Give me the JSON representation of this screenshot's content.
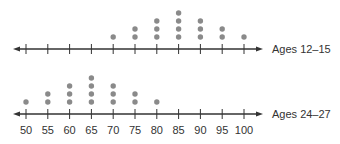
{
  "chart_data": {
    "type": "dot_plot",
    "title": "",
    "xlabel": "",
    "ylabel": "",
    "x_ticks": [
      50,
      55,
      60,
      65,
      70,
      75,
      80,
      85,
      90,
      95,
      100
    ],
    "xlim": [
      50,
      100
    ],
    "grid": false,
    "series": [
      {
        "name": "Ages 12–15",
        "x": [
          70,
          75,
          80,
          85,
          90,
          95,
          100
        ],
        "counts": [
          1,
          2,
          3,
          4,
          3,
          2,
          1
        ]
      },
      {
        "name": "Ages 24–27",
        "x": [
          50,
          55,
          60,
          65,
          70,
          75,
          80
        ],
        "counts": [
          1,
          2,
          3,
          4,
          3,
          2,
          1
        ]
      }
    ],
    "dot_color": "#8a8a8a",
    "axis_color": "#333333"
  },
  "labels": {
    "top_series": "Ages 12–15",
    "bottom_series": "Ages 24–27"
  }
}
